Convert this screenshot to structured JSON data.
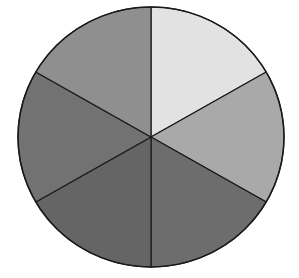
{
  "diagram": {
    "type": "pie",
    "title": "",
    "center": {
      "x": 151,
      "y": 137
    },
    "radius": {
      "rx": 133,
      "ry": 130
    },
    "outline_color": "#1a1a1a",
    "background": "#ffffff",
    "slices": [
      {
        "name": "slice-top-right",
        "start_deg": -90,
        "end_deg": -30,
        "color": "#e2e2e2"
      },
      {
        "name": "slice-right",
        "start_deg": -30,
        "end_deg": 30,
        "color": "#a9a9a9"
      },
      {
        "name": "slice-bottom-right",
        "start_deg": 30,
        "end_deg": 90,
        "color": "#6d6d6d"
      },
      {
        "name": "slice-bottom-left",
        "start_deg": 90,
        "end_deg": 150,
        "color": "#656565"
      },
      {
        "name": "slice-left",
        "start_deg": 150,
        "end_deg": 210,
        "color": "#727272"
      },
      {
        "name": "slice-top-left",
        "start_deg": 210,
        "end_deg": 270,
        "color": "#8f8f8f"
      }
    ]
  },
  "chart_data": {
    "type": "pie",
    "title": "",
    "categories": [
      "Slice 1",
      "Slice 2",
      "Slice 3",
      "Slice 4",
      "Slice 5",
      "Slice 6"
    ],
    "values": [
      16.67,
      16.67,
      16.67,
      16.67,
      16.67,
      16.67
    ],
    "colors": [
      "#e2e2e2",
      "#a9a9a9",
      "#6d6d6d",
      "#656565",
      "#727272",
      "#8f8f8f"
    ],
    "legend": "none"
  }
}
